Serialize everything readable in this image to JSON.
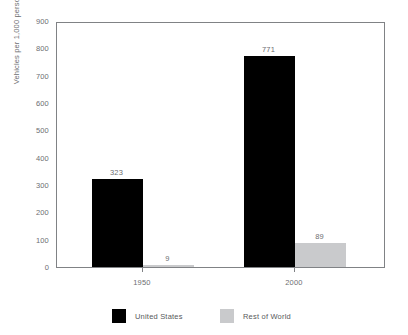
{
  "top_sliver_text": "",
  "chart_data": {
    "type": "bar",
    "title": "",
    "subtitle": "",
    "xlabel": "",
    "ylabel": "Vehicles per 1,000 persons",
    "categories": [
      "1950",
      "2000"
    ],
    "series": [
      {
        "name": "United States",
        "color": "#000000",
        "values": [
          323,
          771
        ]
      },
      {
        "name": "Rest of World",
        "color": "#c9cacc",
        "values": [
          9,
          89
        ]
      }
    ],
    "ylim": [
      0,
      900
    ],
    "ytick_values": [
      0,
      100,
      200,
      300,
      400,
      500,
      600,
      700,
      800,
      900
    ],
    "ytick_labels": [
      "0",
      "100",
      "200",
      "300",
      "400",
      "500",
      "600",
      "700",
      "800",
      "900"
    ],
    "grid": false,
    "legend_position": "bottom",
    "data_labels": {
      "us": [
        "323",
        "771"
      ],
      "row": [
        "9",
        "89"
      ]
    },
    "axis_color": "#808285",
    "text_color": "#6d6e71"
  },
  "legend": {
    "items": [
      {
        "label": "United States",
        "swatch": "us"
      },
      {
        "label": "Rest of World",
        "swatch": "row"
      }
    ]
  }
}
